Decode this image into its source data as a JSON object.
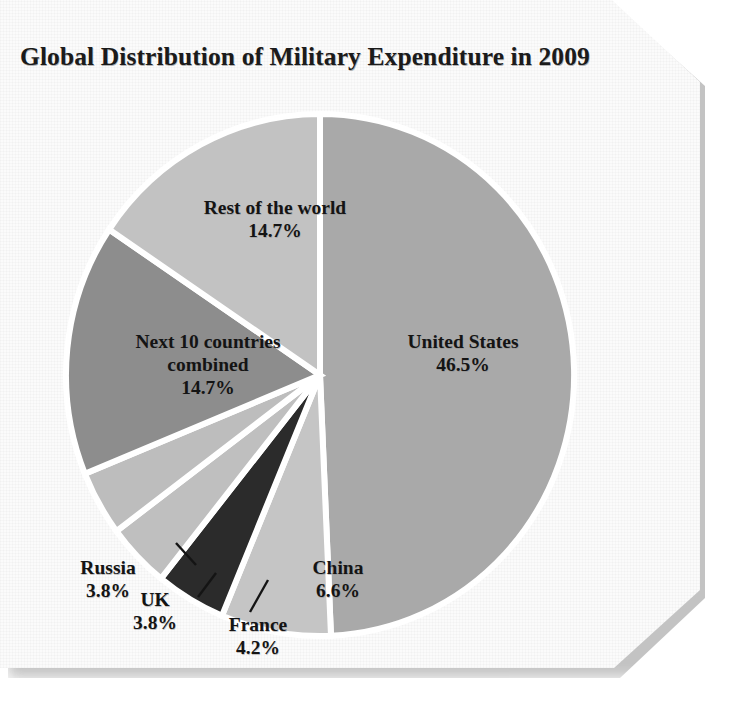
{
  "figure": {
    "title": "Global Distribution of Military Expenditure in 2009",
    "background_color": "#fbfbfb",
    "slice_outline_color": "#ffffff",
    "text_color": "#141414"
  },
  "chart_data": {
    "type": "pie",
    "title": "Global Distribution of Military Expenditure in 2009",
    "xlabel": "",
    "ylabel": "",
    "units": "percent",
    "start_angle_deg": 0,
    "direction": "clockwise",
    "legend_position": "none (labels placed on/near slices)",
    "categories": [
      "United States",
      "China",
      "France",
      "UK",
      "Russia",
      "Next 10 countries combined",
      "Rest of the world"
    ],
    "values": [
      46.5,
      6.6,
      4.2,
      3.8,
      3.8,
      14.7,
      14.7
    ],
    "colors": [
      "#a9a9a9",
      "#c5c5c5",
      "#2b2b2b",
      "#bfbfbf",
      "#bdbdbd",
      "#8d8d8d",
      "#c2c2c2"
    ],
    "slices": [
      {
        "name": "United States",
        "label": "United States",
        "value": 46.5,
        "value_label": "46.5%",
        "color": "#a9a9a9",
        "label_placement": "inside"
      },
      {
        "name": "China",
        "label": "China",
        "value": 6.6,
        "value_label": "6.6%",
        "color": "#c5c5c5",
        "label_placement": "inside"
      },
      {
        "name": "France",
        "label": "France",
        "value": 4.2,
        "value_label": "4.2%",
        "color": "#2b2b2b",
        "label_placement": "outside-leader"
      },
      {
        "name": "UK",
        "label": "UK",
        "value": 3.8,
        "value_label": "3.8%",
        "color": "#bfbfbf",
        "label_placement": "outside-leader"
      },
      {
        "name": "Russia",
        "label": "Russia",
        "value": 3.8,
        "value_label": "3.8%",
        "color": "#bdbdbd",
        "label_placement": "outside-leader"
      },
      {
        "name": "Next 10 countries combined",
        "label": "Next 10 countries",
        "label_line2": "combined",
        "value": 14.7,
        "value_label": "14.7%",
        "color": "#8d8d8d",
        "label_placement": "inside"
      },
      {
        "name": "Rest of the world",
        "label": "Rest of the world",
        "value": 14.7,
        "value_label": "14.7%",
        "color": "#c2c2c2",
        "label_placement": "inside"
      }
    ],
    "total": 94.3,
    "grid": false
  }
}
